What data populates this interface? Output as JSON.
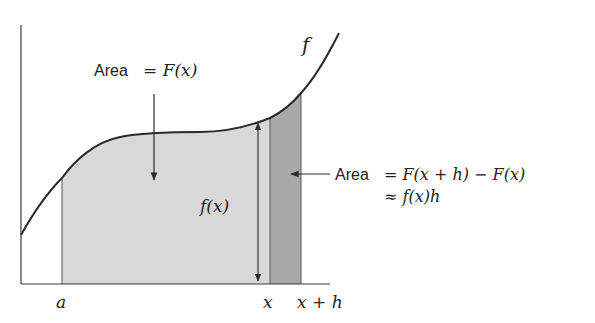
{
  "diagram": {
    "colors": {
      "curve": "#2a2a2a",
      "axis": "#3a3a3a",
      "region_fill": "#d8d8d8",
      "strip_fill": "#a9a9a9",
      "text": "#222222"
    },
    "labels": {
      "curve_name": "f",
      "area_label_word": "Area",
      "area_label_eq": "= F(x)",
      "height_label": "f(x)",
      "strip_area_word": "Area",
      "strip_line1": "= F(x + h) − F(x)",
      "strip_line2": "≈ f(x)h",
      "tick_a": "a",
      "tick_x": "x",
      "tick_xh": "x + h"
    }
  }
}
